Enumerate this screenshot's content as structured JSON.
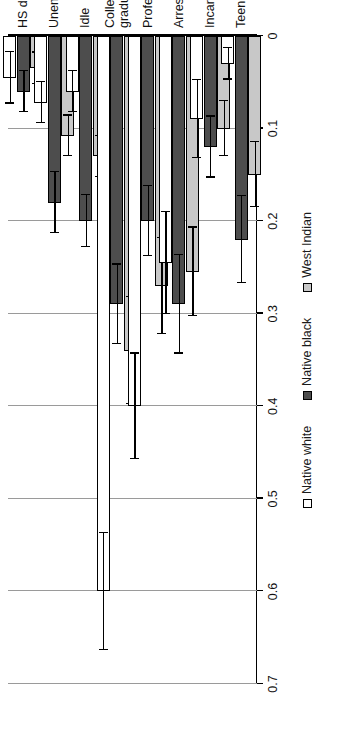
{
  "chart_data": {
    "type": "bar",
    "orientation": "vertical-groups-rotated",
    "title": "",
    "xlabel": "",
    "ylabel": "",
    "ylim": [
      0,
      0.7
    ],
    "grid": true,
    "legend_position": "bottom",
    "tick_labels": [
      "0",
      "0.1",
      "0.2",
      "0.3",
      "0.4",
      "0.5",
      "0.6",
      "0.7"
    ],
    "tick_values": [
      0,
      0.1,
      0.2,
      0.3,
      0.4,
      0.5,
      0.6,
      0.7
    ],
    "categories": [
      "HS dropout",
      "Unemployed",
      "Idle",
      "College\ngraduate",
      "Professional",
      "Arrested",
      "Incarcerated",
      "Teen parent"
    ],
    "series": [
      {
        "name": "Native white",
        "color": "#ffffff",
        "values": [
          0.045,
          0.072,
          0.06,
          0.6,
          0.4,
          0.245,
          0.09,
          0.03
        ],
        "errors": [
          0.028,
          0.022,
          0.022,
          0.063,
          0.057,
          0.055,
          0.042,
          0.017
        ]
      },
      {
        "name": "Native black",
        "color": "#4d4d4d",
        "values": [
          0.06,
          0.18,
          0.2,
          0.29,
          0.2,
          0.29,
          0.12,
          0.22
        ],
        "errors": [
          0.022,
          0.033,
          0.028,
          0.043,
          0.038,
          0.053,
          0.033,
          0.047
        ]
      },
      {
        "name": "West Indian",
        "color": "#c8c8c8",
        "values": [
          0.035,
          0.108,
          0.13,
          0.34,
          0.27,
          0.255,
          0.1,
          0.15
        ],
        "errors": [
          0.017,
          0.022,
          0.022,
          0.058,
          0.052,
          0.048,
          0.03,
          0.035
        ]
      }
    ]
  },
  "legend": {
    "items": [
      {
        "label": "Native white"
      },
      {
        "label": "Native black"
      },
      {
        "label": "West Indian"
      }
    ]
  }
}
